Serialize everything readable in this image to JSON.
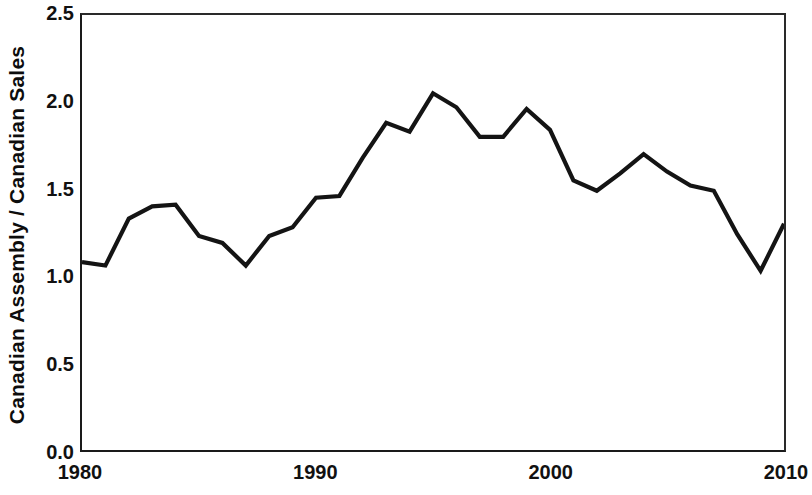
{
  "chart_data": {
    "type": "line",
    "title": "",
    "xlabel": "",
    "ylabel": "Canadian Assembly / Canadian Sales",
    "xlim": [
      1980,
      2010
    ],
    "ylim": [
      0.0,
      2.5
    ],
    "grid": false,
    "legend": null,
    "x_tick_labels": [
      "1980",
      "1990",
      "2000",
      "2010"
    ],
    "x_ticks": [
      1980,
      1990,
      2000,
      2010
    ],
    "y_tick_labels": [
      "0.0",
      "0.5",
      "1.0",
      "1.5",
      "2.0",
      "2.5"
    ],
    "y_ticks": [
      0.0,
      0.5,
      1.0,
      1.5,
      2.0,
      2.5
    ],
    "line_color": "#141414",
    "x": [
      1980,
      1981,
      1982,
      1983,
      1984,
      1985,
      1986,
      1987,
      1988,
      1989,
      1990,
      1991,
      1992,
      1993,
      1994,
      1995,
      1996,
      1997,
      1998,
      1999,
      2000,
      2001,
      2002,
      2003,
      2004,
      2005,
      2006,
      2007,
      2008,
      2009,
      2010
    ],
    "values": [
      1.08,
      1.06,
      1.33,
      1.4,
      1.41,
      1.23,
      1.19,
      1.06,
      1.23,
      1.28,
      1.45,
      1.46,
      1.68,
      1.88,
      1.83,
      2.05,
      1.97,
      1.8,
      1.8,
      1.96,
      1.84,
      1.55,
      1.49,
      1.59,
      1.7,
      1.6,
      1.52,
      1.49,
      1.24,
      1.03,
      1.3
    ],
    "series": [
      {
        "name": "Canadian Assembly / Canadian Sales",
        "values": [
          1.08,
          1.06,
          1.33,
          1.4,
          1.41,
          1.23,
          1.19,
          1.06,
          1.23,
          1.28,
          1.45,
          1.46,
          1.68,
          1.88,
          1.83,
          2.05,
          1.97,
          1.8,
          1.8,
          1.96,
          1.84,
          1.55,
          1.49,
          1.59,
          1.7,
          1.6,
          1.52,
          1.49,
          1.24,
          1.03,
          1.3
        ]
      }
    ]
  }
}
